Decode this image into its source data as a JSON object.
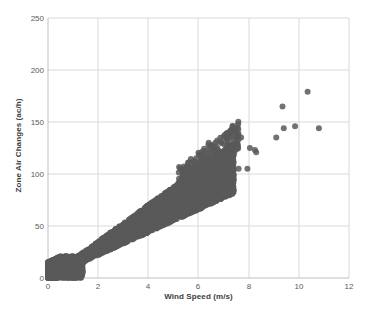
{
  "chart_data": {
    "type": "scatter",
    "title": "",
    "xlabel": "Wind Speed (m/s)",
    "ylabel": "Zone Air Changes (ac/h)",
    "xlim": [
      0,
      12
    ],
    "ylim": [
      0,
      250
    ],
    "xticks": [
      0,
      2,
      4,
      6,
      8,
      10,
      12
    ],
    "yticks": [
      0,
      50,
      100,
      150,
      200,
      250
    ],
    "xtick_labels": [
      "0",
      "2",
      "4",
      "6",
      "8",
      "10",
      "12"
    ],
    "ytick_labels": [
      "0",
      "50",
      "100",
      "150",
      "200",
      "250"
    ],
    "grid": true,
    "grid_color": "#D9D9D9",
    "legend": "none",
    "marker_color": "#595959",
    "marker_size": 4,
    "marker_shape": "circle",
    "series": [
      {
        "name": "Zone Air Changes vs Wind Speed",
        "description": "Dense wedge-shaped cloud rising from the origin with an approximate slope of 14 ac/h per m/s, widening with wind speed; a small set of high-wind outliers sits above and to the right of the main cloud.",
        "outliers": [
          {
            "x": 9.1,
            "y": 135
          },
          {
            "x": 9.35,
            "y": 165
          },
          {
            "x": 9.4,
            "y": 144
          },
          {
            "x": 9.85,
            "y": 146
          },
          {
            "x": 10.35,
            "y": 179
          },
          {
            "x": 10.8,
            "y": 144
          },
          {
            "x": 7.55,
            "y": 136
          },
          {
            "x": 7.7,
            "y": 135
          },
          {
            "x": 8.05,
            "y": 125
          },
          {
            "x": 8.25,
            "y": 123
          },
          {
            "x": 8.3,
            "y": 121
          },
          {
            "x": 7.6,
            "y": 105
          },
          {
            "x": 7.95,
            "y": 105
          },
          {
            "x": 7.35,
            "y": 104
          },
          {
            "x": 7.4,
            "y": 99
          }
        ],
        "cloud_envelope": {
          "upper_slope": 17.5,
          "lower_slope": 11.0,
          "x_max": 7.4,
          "origin_blob": {
            "x_max": 1.4,
            "y_max": 21
          }
        }
      }
    ]
  },
  "axis": {
    "x_title": "Wind Speed (m/s)",
    "y_title": "Zone Air Changes (ac/h)"
  }
}
